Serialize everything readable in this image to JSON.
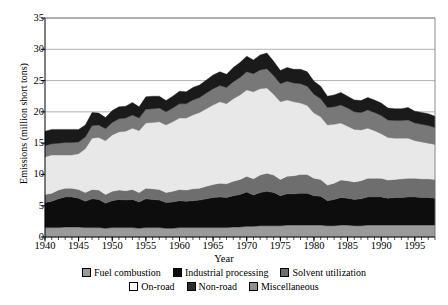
{
  "chart_data": {
    "type": "area",
    "stacked": true,
    "title": "",
    "xlabel": "Year",
    "ylabel": "Emissions (million short tons)",
    "xlim": [
      1940,
      1998
    ],
    "ylim": [
      0,
      35
    ],
    "ytick_values": [
      0,
      5,
      10,
      15,
      20,
      25,
      30,
      35
    ],
    "xtick_values": [
      1940,
      1945,
      1950,
      1955,
      1960,
      1965,
      1970,
      1975,
      1980,
      1985,
      1990,
      1995
    ],
    "xtick_labels": [
      "1940",
      "1945",
      "1950",
      "1955",
      "1960",
      "1965",
      "1970",
      "1975",
      "1980",
      "1985",
      "1990",
      "1995"
    ],
    "ytick_labels": [
      "0",
      "5",
      "10",
      "15",
      "20",
      "25",
      "30",
      "35"
    ],
    "grid": "horizontal",
    "legend_position": "bottom",
    "minor_xticks": true,
    "x": [
      1940,
      1941,
      1942,
      1943,
      1944,
      1945,
      1946,
      1947,
      1948,
      1949,
      1950,
      1951,
      1952,
      1953,
      1954,
      1955,
      1956,
      1957,
      1958,
      1959,
      1960,
      1961,
      1962,
      1963,
      1964,
      1965,
      1966,
      1967,
      1968,
      1969,
      1970,
      1971,
      1972,
      1973,
      1974,
      1975,
      1976,
      1977,
      1978,
      1979,
      1980,
      1981,
      1982,
      1983,
      1984,
      1985,
      1986,
      1987,
      1988,
      1989,
      1990,
      1991,
      1992,
      1993,
      1994,
      1995,
      1996,
      1997,
      1998
    ],
    "series": [
      {
        "name": "Fuel combustion",
        "color": "#9a9a9a",
        "values": [
          1.5,
          1.5,
          1.5,
          1.6,
          1.6,
          1.6,
          1.5,
          1.5,
          1.5,
          1.4,
          1.5,
          1.5,
          1.5,
          1.5,
          1.4,
          1.5,
          1.5,
          1.5,
          1.4,
          1.4,
          1.5,
          1.5,
          1.5,
          1.5,
          1.5,
          1.5,
          1.5,
          1.5,
          1.6,
          1.6,
          1.7,
          1.7,
          1.8,
          1.8,
          1.8,
          1.8,
          1.9,
          1.9,
          1.9,
          1.9,
          1.9,
          1.9,
          1.8,
          1.8,
          1.9,
          1.9,
          1.8,
          1.8,
          1.9,
          1.9,
          1.9,
          1.9,
          1.9,
          1.9,
          1.9,
          1.9,
          1.9,
          1.9,
          1.9
        ]
      },
      {
        "name": "Industrial processing",
        "color": "#0d0d0d",
        "values": [
          4.0,
          4.2,
          4.6,
          4.8,
          4.8,
          4.6,
          4.2,
          4.6,
          4.5,
          4.0,
          4.3,
          4.5,
          4.4,
          4.5,
          4.2,
          4.6,
          4.5,
          4.4,
          4.1,
          4.2,
          4.3,
          4.2,
          4.3,
          4.4,
          4.6,
          4.8,
          4.9,
          4.8,
          5.0,
          5.2,
          5.5,
          5.0,
          5.3,
          5.5,
          5.3,
          4.8,
          5.0,
          5.0,
          5.1,
          5.1,
          4.7,
          4.6,
          4.0,
          4.2,
          4.4,
          4.3,
          4.2,
          4.3,
          4.5,
          4.5,
          4.5,
          4.3,
          4.4,
          4.4,
          4.5,
          4.5,
          4.4,
          4.4,
          4.3
        ]
      },
      {
        "name": "Solvent utilization",
        "color": "#6e6e6e",
        "values": [
          1.3,
          1.3,
          1.4,
          1.4,
          1.4,
          1.4,
          1.4,
          1.5,
          1.5,
          1.4,
          1.5,
          1.5,
          1.5,
          1.6,
          1.5,
          1.7,
          1.7,
          1.7,
          1.6,
          1.7,
          1.8,
          1.8,
          1.9,
          1.9,
          2.0,
          2.1,
          2.2,
          2.2,
          2.3,
          2.4,
          2.5,
          2.6,
          2.8,
          2.9,
          2.8,
          2.6,
          2.8,
          2.9,
          3.0,
          3.0,
          2.8,
          2.7,
          2.5,
          2.6,
          2.8,
          2.8,
          2.8,
          2.9,
          3.0,
          3.0,
          3.0,
          2.9,
          2.9,
          3.0,
          3.0,
          3.0,
          3.0,
          3.0,
          3.0
        ]
      },
      {
        "name": "On-road",
        "color": "#e8e8e8",
        "values": [
          6.0,
          6.1,
          5.6,
          5.3,
          5.3,
          5.7,
          7.0,
          8.2,
          8.4,
          8.6,
          9.0,
          9.3,
          9.5,
          9.8,
          9.9,
          10.4,
          10.6,
          10.8,
          10.8,
          11.1,
          11.4,
          11.5,
          11.8,
          12.1,
          12.4,
          12.7,
          13.0,
          12.8,
          13.2,
          13.5,
          13.8,
          13.9,
          13.8,
          13.6,
          12.9,
          12.4,
          12.2,
          11.8,
          11.4,
          11.0,
          10.4,
          10.0,
          9.6,
          9.4,
          9.1,
          8.7,
          8.4,
          8.1,
          8.0,
          7.6,
          7.1,
          6.8,
          6.6,
          6.5,
          6.4,
          6.0,
          5.9,
          5.7,
          5.6
        ]
      },
      {
        "name": "Non-road",
        "color": "#787878",
        "values": [
          1.8,
          1.8,
          1.9,
          2.0,
          2.0,
          1.9,
          1.9,
          2.0,
          2.0,
          1.9,
          2.0,
          2.1,
          2.1,
          2.1,
          2.0,
          2.2,
          2.2,
          2.2,
          2.1,
          2.2,
          2.3,
          2.3,
          2.4,
          2.4,
          2.5,
          2.6,
          2.6,
          2.6,
          2.7,
          2.8,
          2.9,
          2.9,
          3.0,
          3.1,
          3.0,
          2.9,
          3.0,
          3.0,
          3.1,
          3.1,
          3.0,
          2.9,
          2.8,
          2.8,
          2.9,
          2.9,
          2.8,
          2.8,
          2.9,
          2.9,
          2.9,
          2.8,
          2.8,
          2.8,
          2.9,
          2.8,
          2.8,
          2.8,
          2.7
        ]
      },
      {
        "name": "Miscellaneous",
        "color": "#1a1a1a",
        "values": [
          2.3,
          2.3,
          2.2,
          2.1,
          2.1,
          2.0,
          1.9,
          2.1,
          1.9,
          1.8,
          1.9,
          1.9,
          1.9,
          2.0,
          1.8,
          2.0,
          2.0,
          1.9,
          1.8,
          1.9,
          2.0,
          1.9,
          2.0,
          2.0,
          2.1,
          2.2,
          2.2,
          2.1,
          2.3,
          2.4,
          2.5,
          2.2,
          2.4,
          2.5,
          2.3,
          2.1,
          2.2,
          2.2,
          2.3,
          2.3,
          2.1,
          2.0,
          1.8,
          1.9,
          2.0,
          1.9,
          1.9,
          1.9,
          2.0,
          2.0,
          2.0,
          1.9,
          1.9,
          1.9,
          2.0,
          1.9,
          1.9,
          1.9,
          1.8
        ]
      }
    ]
  },
  "legend": {
    "row1": [
      {
        "label": "Fuel combustion",
        "color": "#9a9a9a"
      },
      {
        "label": "Industrial processing",
        "color": "#0d0d0d"
      },
      {
        "label": "Solvent utilization",
        "color": "#6e6e6e"
      }
    ],
    "row2": [
      {
        "label": "On-road",
        "color": "#ffffff"
      },
      {
        "label": "Non-road",
        "color": "#2b2b2b"
      },
      {
        "label": "Miscellaneous",
        "color": "#8f8f8f"
      }
    ]
  }
}
